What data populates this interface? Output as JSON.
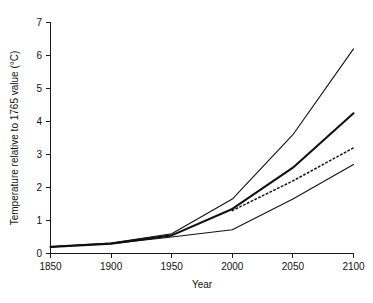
{
  "chart_data": {
    "type": "line",
    "title": "",
    "xlabel": "Year",
    "ylabel": "Temperature relative to 1765 value (°C)",
    "xlim": [
      1850,
      2100
    ],
    "ylim": [
      0,
      7
    ],
    "xticks": [
      1850,
      1900,
      1950,
      2000,
      2050,
      2100
    ],
    "yticks": [
      0,
      1,
      2,
      3,
      4,
      5,
      6,
      7
    ],
    "grid": false,
    "legend": "none",
    "x": [
      1850,
      1900,
      1950,
      2000,
      2050,
      2100
    ],
    "series": [
      {
        "name": "high-scenario",
        "style": "solid-thin",
        "values": [
          0.2,
          0.32,
          0.6,
          1.65,
          3.6,
          6.2
        ]
      },
      {
        "name": "mid-high-scenario",
        "style": "solid-thick",
        "values": [
          0.2,
          0.3,
          0.55,
          1.35,
          2.6,
          4.25
        ]
      },
      {
        "name": "mid-scenario-dotted",
        "style": "dotted",
        "values": [
          null,
          null,
          null,
          1.3,
          2.2,
          3.2
        ]
      },
      {
        "name": "low-scenario",
        "style": "solid-thin",
        "values": [
          0.2,
          0.3,
          0.5,
          0.72,
          1.65,
          2.7
        ]
      }
    ]
  },
  "axes": {
    "y_tick_labels": [
      "0",
      "1",
      "2",
      "3",
      "4",
      "5",
      "6",
      "7"
    ],
    "x_tick_labels": [
      "1850",
      "1900",
      "1950",
      "2000",
      "2050",
      "2100"
    ],
    "y_axis_title": "Temperature relative to 1765 value (°C)",
    "x_axis_title": "Year"
  },
  "colors": {
    "background": "#ffffff",
    "axis": "#1a1a1a",
    "line": "#111111"
  }
}
